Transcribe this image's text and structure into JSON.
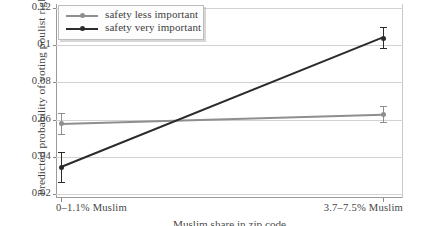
{
  "chart_data": {
    "type": "line",
    "title": "",
    "xlabel": "Muslim share in zip code",
    "ylabel": "Predicted probability of voting poulist right",
    "categories": [
      "0–1.1% Muslim",
      "3.7–7.5% Muslim"
    ],
    "ylim": [
      0.018,
      0.122
    ],
    "yticks": [
      "0.12",
      "0.1",
      "0.08",
      "0.06",
      "0.04",
      "0.02"
    ],
    "ytick_values": [
      0.12,
      0.1,
      0.08,
      0.06,
      0.04,
      0.02
    ],
    "grid": true,
    "legend_position": "top-left",
    "series": [
      {
        "name": "safety less important",
        "color": "#8e8e8e",
        "values": [
          0.058,
          0.063
        ],
        "err_low": [
          0.0525,
          0.0585
        ],
        "err_high": [
          0.0635,
          0.0675
        ]
      },
      {
        "name": "safety very important",
        "color": "#2b2b2b",
        "values": [
          0.0345,
          0.104
        ],
        "err_low": [
          0.0265,
          0.0985
        ],
        "err_high": [
          0.0425,
          0.1095
        ]
      }
    ]
  },
  "axes": {
    "y_title": "Predicted probability of voting poulist right",
    "x_title": "Muslim share in zip code",
    "y_tick_labels": [
      "0.12",
      "0.1",
      "0.08",
      "0.06",
      "0.04",
      "0.02"
    ],
    "x_tick_labels": [
      "0–1.1% Muslim",
      "3.7–7.5% Muslim"
    ]
  },
  "legend": {
    "entries": [
      {
        "label": "safety less important"
      },
      {
        "label": "safety very important"
      }
    ]
  }
}
